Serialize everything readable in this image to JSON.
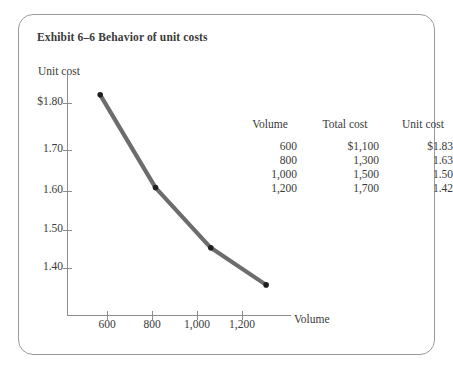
{
  "top_clipped_text": "                         ",
  "figure": {
    "title": "Exhibit 6–6 Behavior of unit costs"
  },
  "chart_data": {
    "type": "line",
    "title": "Exhibit 6–6 Behavior of unit costs",
    "xlabel": "Volume",
    "ylabel": "Unit cost",
    "x": [
      600,
      800,
      1000,
      1200
    ],
    "values": [
      1.83,
      1.63,
      1.5,
      1.42
    ],
    "series": [
      {
        "name": "Unit cost",
        "values": [
          1.83,
          1.63,
          1.5,
          1.42
        ]
      }
    ],
    "x_tick_labels": [
      "600",
      "800",
      "1,000",
      "1,200"
    ],
    "x_tick_values": [
      600,
      800,
      1000,
      1200
    ],
    "y_tick_labels": [
      "$1.80",
      "1.70",
      "1.60",
      "1.50",
      "1.40"
    ],
    "y_tick_values": [
      1.8,
      1.7,
      1.6,
      1.5,
      1.4
    ],
    "xlim": [
      480,
      1290
    ],
    "ylim": [
      1.355,
      1.875
    ],
    "grid": false,
    "legend": "none",
    "line_color": "#6d6d6d",
    "marker_color": "#1f1f1f",
    "axis_color": "#8d8d8d"
  },
  "table": {
    "headers": [
      "Volume",
      "Total cost",
      "Unit cost"
    ],
    "rows": [
      {
        "volume": "600",
        "total_cost": "$1,100",
        "unit_cost": "$1.83"
      },
      {
        "volume": "800",
        "total_cost": "1,300",
        "unit_cost": "1.63"
      },
      {
        "volume": "1,000",
        "total_cost": "1,500",
        "unit_cost": "1.50"
      },
      {
        "volume": "1,200",
        "total_cost": "1,700",
        "unit_cost": "1.42"
      }
    ]
  }
}
